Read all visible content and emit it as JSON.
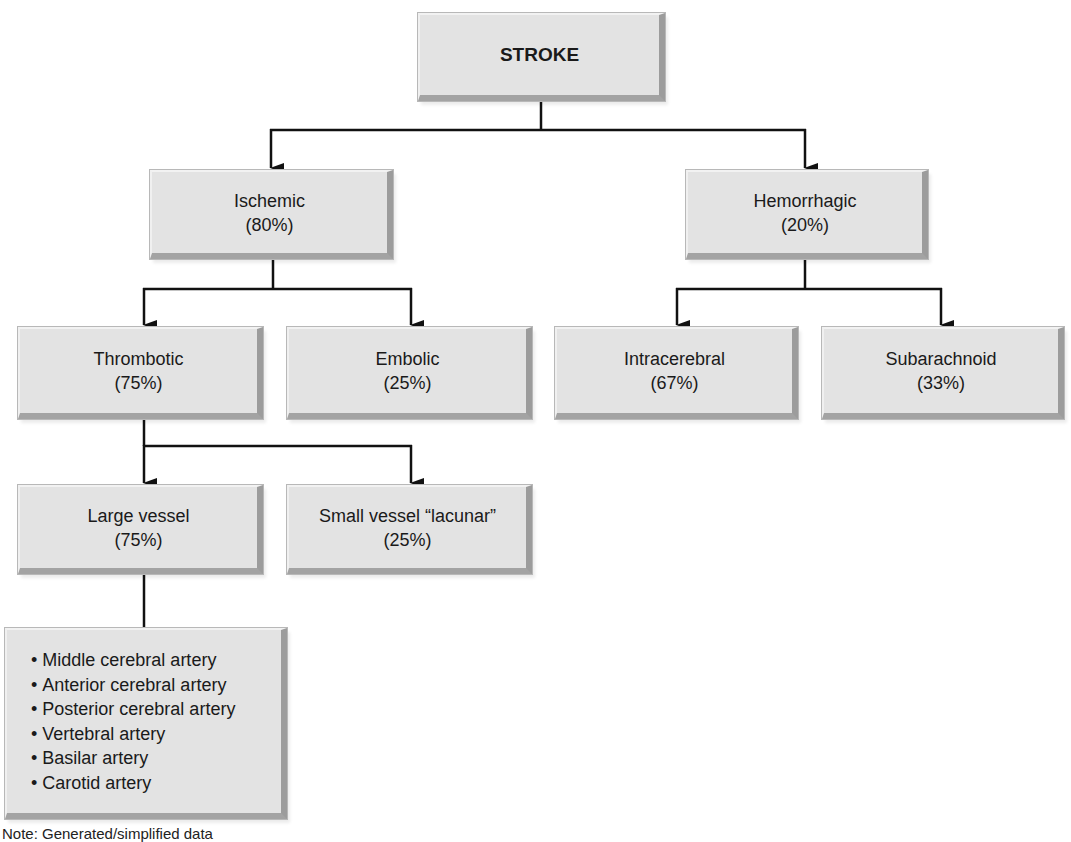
{
  "diagram": {
    "root": {
      "title": "STROKE"
    },
    "ischemic": {
      "title": "Ischemic",
      "pct": "(80%)"
    },
    "hemorrhagic": {
      "title": "Hemorrhagic",
      "pct": "(20%)"
    },
    "thrombotic": {
      "title": "Thrombotic",
      "pct": "(75%)"
    },
    "embolic": {
      "title": "Embolic",
      "pct": "(25%)"
    },
    "intracerebral": {
      "title": "Intracerebral",
      "pct": "(67%)"
    },
    "subarachnoid": {
      "title": "Subarachnoid",
      "pct": "(33%)"
    },
    "large_vessel": {
      "title": "Large vessel",
      "pct": "(75%)"
    },
    "small_vessel": {
      "title": "Small vessel “lacunar”",
      "pct": "(25%)"
    },
    "arteries": {
      "items": [
        "Middle cerebral artery",
        "Anterior cerebral artery",
        "Posterior cerebral artery",
        "Vertebral artery",
        "Basilar artery",
        "Carotid artery"
      ]
    },
    "note": "Note: Generated/simplified data"
  },
  "colors": {
    "box_fill": "#e3e3e3",
    "box_shadow_edge": "#9c9c9c",
    "line": "#111111"
  }
}
